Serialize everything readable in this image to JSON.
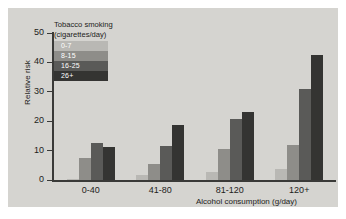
{
  "chart_data": {
    "type": "bar",
    "title": "",
    "xlabel": "Alcohol consumption (g/day)",
    "ylabel": "Relative risk",
    "categories": [
      "0-40",
      "41-80",
      "81-120",
      "120+"
    ],
    "yticks": [
      0,
      10,
      20,
      30,
      40,
      50
    ],
    "ylim": [
      0,
      50
    ],
    "grid": false,
    "legend_title_line1": "Tobacco smoking",
    "legend_title_line2": "(cigarettes/day)",
    "legend_position": "top-left inside axes",
    "series": [
      {
        "name": "0-7",
        "color": "#b9b8b4",
        "values": [
          0.5,
          1.6,
          2.6,
          3.6
        ]
      },
      {
        "name": "8-15",
        "color": "#8e8d89",
        "values": [
          7.6,
          5.6,
          10.7,
          11.8
        ]
      },
      {
        "name": "16-25",
        "color": "#5a5a58",
        "values": [
          12.6,
          11.5,
          20.8,
          31.0
        ]
      },
      {
        "name": "26+",
        "color": "#343432",
        "values": [
          11.1,
          18.8,
          23.3,
          42.5
        ]
      }
    ]
  },
  "colors": {
    "panel": "#d5d4d0",
    "axis": "#3a3a38",
    "text": "#1d1d1b",
    "legend_label_text": "#ffffff"
  }
}
